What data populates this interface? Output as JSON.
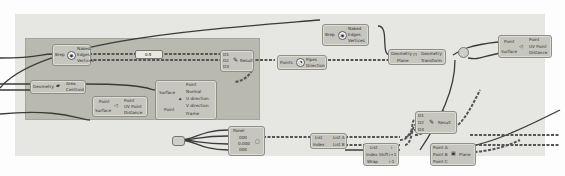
{
  "canvas": {
    "background": "#fdfdfd",
    "group_color": "#b9b9b0",
    "wire_color": "#3a3a3a"
  },
  "nodes": {
    "brep_edges": {
      "input": "Brep",
      "outputs": [
        "Naked",
        "Edges",
        "Vertices"
      ]
    },
    "number_slider": {
      "value": "0.5"
    },
    "area": {
      "input": "Geometry",
      "outputs": [
        "Area",
        "Centroid"
      ]
    },
    "surface_cp": {
      "inputs": [
        "Point",
        "Surface"
      ],
      "outputs": [
        "Point",
        "UV Point",
        "Distance"
      ]
    },
    "evaluate_surface": {
      "inputs": [
        "Surface",
        "Point"
      ],
      "outputs": [
        "Point",
        "Normal",
        "U direction",
        "V direction",
        "Frame"
      ]
    },
    "dispatch": {
      "inputs": [
        "D1",
        "D2",
        "D3"
      ],
      "output": "Result"
    },
    "pipe_top": {
      "input": "Points",
      "outputs": [
        "Pipes",
        "Direction"
      ]
    },
    "brep_edges_2": {
      "input": "Brep",
      "outputs": [
        "Naked",
        "Edges",
        "Vertices"
      ]
    },
    "transform": {
      "inputs": [
        "Geometry",
        "Plane"
      ],
      "outputs": [
        "Geometry",
        "Transform"
      ]
    },
    "closest_point": {
      "inputs": [
        "Point",
        "Surface"
      ],
      "outputs": [
        "Point",
        "UV Point",
        "Distance"
      ]
    },
    "panel": {
      "header": "Panel",
      "rows": [
        "000",
        "0.000",
        "000"
      ]
    },
    "list_item": {
      "inputs": [
        "List",
        "Index"
      ],
      "outputs": [
        "List A",
        "List B"
      ]
    },
    "series": {
      "inputs": [
        "List",
        "Index Shift",
        "Wrap"
      ],
      "outputs": [
        "i",
        "i+1",
        "i-1"
      ]
    },
    "merge_bottom": {
      "inputs": [
        "D1",
        "D2",
        "D3"
      ],
      "output": "Result"
    },
    "line_3pt": {
      "inputs": [
        "Point A",
        "Point B",
        "Point C"
      ],
      "output": "Plane"
    }
  }
}
